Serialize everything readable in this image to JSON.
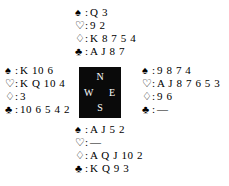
{
  "diagram": {
    "kind": "bridge-deal-diagram",
    "background_color": "#ffffff",
    "text_color": "#000000",
    "suits": [
      {
        "key": "spades",
        "icon": "spade-icon",
        "glyph": "♠",
        "filled": true,
        "separator": ":"
      },
      {
        "key": "hearts",
        "icon": "heart-icon",
        "glyph": "♡",
        "filled": false,
        "separator": ":"
      },
      {
        "key": "diamonds",
        "icon": "diamond-icon",
        "glyph": "♢",
        "filled": false,
        "separator": ":"
      },
      {
        "key": "clubs",
        "icon": "club-icon",
        "glyph": "♣",
        "filled": true,
        "separator": ":"
      }
    ],
    "void_mark": "—",
    "compass": {
      "background_color": "#0a0a0a",
      "label_color": "#ffffff",
      "north": "N",
      "west": "W",
      "east": "E",
      "south": "S"
    },
    "hands": {
      "north": {
        "position": "North",
        "spades": "Q 3",
        "hearts": "9 2",
        "diamonds": "K 8 7 5 4",
        "clubs": "A J 8 7"
      },
      "west": {
        "position": "West",
        "spades": "K 10 6",
        "hearts": "K Q 10 4",
        "diamonds": "3",
        "clubs": "10 6 5 4 2"
      },
      "east": {
        "position": "East",
        "spades": "9 8 7 4",
        "hearts": "A J 8 7 6 5 3",
        "diamonds": "9 6",
        "clubs": "—"
      },
      "south": {
        "position": "South",
        "spades": "A J 5 2",
        "hearts": "—",
        "diamonds": "A Q J 10 2",
        "clubs": "K Q 9 3"
      }
    }
  }
}
